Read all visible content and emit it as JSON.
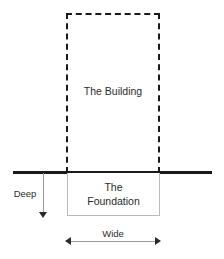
{
  "diagram": {
    "building": {
      "label": "The Building",
      "outline_style": "dashed",
      "outline_color": "#1a1a1a"
    },
    "ground": {
      "line_color": "#1a1a1a",
      "line_thickness_px": 3
    },
    "foundation": {
      "label_line_1": "The",
      "label_line_2": "Foundation",
      "outline_style": "solid",
      "outline_color": "#b9b9b9"
    },
    "dimensions": {
      "depth": {
        "label": "Deep",
        "direction": "vertical-down",
        "arrow_color": "#2b2b2b"
      },
      "width": {
        "label": "Wide",
        "direction": "horizontal-both",
        "arrow_color": "#2b2b2b"
      }
    }
  }
}
